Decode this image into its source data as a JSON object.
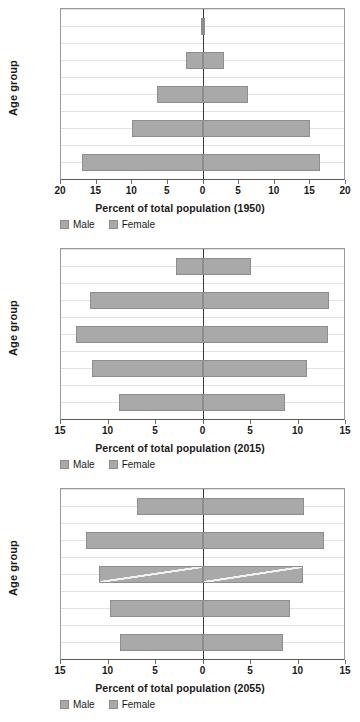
{
  "charts": [
    {
      "id": "pyramid-1950",
      "ylabel": "Age group",
      "xtitle": "Percent of total population (1950)",
      "legend": {
        "male": "Male",
        "female": "Female"
      },
      "ticks": [
        "20",
        "15",
        "10",
        "5",
        "0",
        "5",
        "10",
        "15",
        "20"
      ],
      "categories": [
        "0–19",
        "20–39",
        "40–59",
        "60–79",
        "80+"
      ]
    },
    {
      "id": "pyramid-2015",
      "ylabel": "Age group",
      "xtitle": "Percent of total population (2015)",
      "legend": {
        "male": "Male",
        "female": "Female"
      },
      "ticks": [
        "15",
        "10",
        "5",
        "0",
        "5",
        "10",
        "15"
      ],
      "categories": [
        "0–19",
        "20–39",
        "40–59",
        "60–79",
        "80+"
      ]
    },
    {
      "id": "pyramid-2055",
      "ylabel": "Age group",
      "xtitle": "Percent of total population (2055)",
      "legend": {
        "male": "Male",
        "female": "Female"
      },
      "ticks": [
        "15",
        "10",
        "5",
        "0",
        "5",
        "10",
        "15"
      ],
      "categories": [
        "0–19",
        "20–39",
        "40–59",
        "60–79",
        "80+"
      ]
    }
  ],
  "chart_data": [
    {
      "type": "bar",
      "subtype": "population-pyramid",
      "title": "Percent of total population (1950)",
      "xlabel": "Percent of total population (1950)",
      "ylabel": "Age group",
      "categories": [
        "0–19",
        "20–39",
        "40–59",
        "60–79",
        "80+"
      ],
      "series": [
        {
          "name": "Male",
          "side": "left",
          "values": [
            17.1,
            10.0,
            6.5,
            2.3,
            0.2
          ]
        },
        {
          "name": "Female",
          "side": "right",
          "values": [
            16.6,
            15.2,
            6.5,
            3.0,
            0.2
          ]
        }
      ],
      "xlim": [
        -20,
        20
      ],
      "xticks": [
        -20,
        -15,
        -10,
        -5,
        0,
        5,
        10,
        15,
        20
      ],
      "xticklabels": [
        "20",
        "15",
        "10",
        "5",
        "0",
        "5",
        "10",
        "15",
        "20"
      ],
      "grid": true,
      "legend_position": "bottom-left"
    },
    {
      "type": "bar",
      "subtype": "population-pyramid",
      "title": "Percent of total population (2015)",
      "xlabel": "Percent of total population (2015)",
      "ylabel": "Age group",
      "categories": [
        "0–19",
        "20–39",
        "40–59",
        "60–79",
        "80+"
      ],
      "series": [
        {
          "name": "Male",
          "side": "left",
          "values": [
            8.9,
            11.7,
            13.4,
            11.9,
            2.8
          ]
        },
        {
          "name": "Female",
          "side": "right",
          "values": [
            8.7,
            11.1,
            13.3,
            13.4,
            5.1
          ]
        }
      ],
      "xlim": [
        -15,
        15
      ],
      "xticks": [
        -15,
        -10,
        -5,
        0,
        5,
        10,
        15
      ],
      "xticklabels": [
        "15",
        "10",
        "5",
        "0",
        "5",
        "10",
        "15"
      ],
      "grid": true,
      "legend_position": "bottom-left"
    },
    {
      "type": "bar",
      "subtype": "population-pyramid",
      "title": "Percent of total population (2055)",
      "xlabel": "Percent of total population (2055)",
      "ylabel": "Age group",
      "categories": [
        "0–19",
        "20–39",
        "40–59",
        "60–79",
        "80+"
      ],
      "series": [
        {
          "name": "Male",
          "side": "left",
          "values": [
            8.8,
            9.8,
            11.0,
            12.3,
            6.9
          ]
        },
        {
          "name": "Female",
          "side": "right",
          "values": [
            8.5,
            9.3,
            10.7,
            12.9,
            10.8
          ]
        }
      ],
      "xlim": [
        -15,
        15
      ],
      "xticks": [
        -15,
        -10,
        -5,
        0,
        5,
        10,
        15
      ],
      "xticklabels": [
        "15",
        "10",
        "5",
        "0",
        "5",
        "10",
        "15"
      ],
      "grid": true,
      "legend_position": "bottom-left",
      "annotations": [
        {
          "type": "diagonal-line-artifact",
          "category": "40–59",
          "color": "#ffffff"
        }
      ]
    }
  ]
}
